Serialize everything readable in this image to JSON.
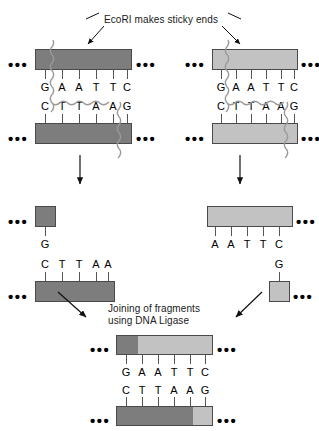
{
  "figure": {
    "title": "EcoRI makes sticky ends",
    "ligase_caption_line1": "Joining of fragments",
    "ligase_caption_line2": "using DNA Ligase",
    "ellipsis": "•••"
  },
  "colors": {
    "dark_dna": "#7d7d7d",
    "light_dna": "#c2c2c2",
    "outline": "#4a4a4a",
    "background": "#ffffff",
    "text": "#000000"
  },
  "panels": {
    "top_left": {
      "label": "uncut-dna-duplex-dark",
      "top_strand_bases": [
        "G",
        "A",
        "A",
        "T",
        "T",
        "C"
      ],
      "bottom_strand_bases": [
        "C",
        "T",
        "T",
        "A",
        "A",
        "G"
      ],
      "cut_after_top_base_index": 0,
      "cut_after_bottom_base_index": 4
    },
    "top_right": {
      "label": "uncut-dna-duplex-light",
      "top_strand_bases": [
        "G",
        "A",
        "A",
        "T",
        "T",
        "C"
      ],
      "bottom_strand_bases": [
        "C",
        "T",
        "T",
        "A",
        "A",
        "G"
      ],
      "cut_after_top_base_index": 0,
      "cut_after_bottom_base_index": 4
    },
    "mid_left": {
      "label": "cut-fragment-dark",
      "top_strand_bases": [
        "G"
      ],
      "bottom_strand_bases": [
        "C",
        "T",
        "T",
        "A",
        "A"
      ]
    },
    "mid_right": {
      "label": "cut-fragment-light",
      "top_strand_bases": [
        "A",
        "A",
        "T",
        "T",
        "C"
      ],
      "bottom_strand_bases": [
        "G"
      ]
    },
    "bottom": {
      "label": "recombinant-dna",
      "top_strand_bases": [
        "G",
        "A",
        "A",
        "T",
        "T",
        "C"
      ],
      "bottom_strand_bases": [
        "C",
        "T",
        "T",
        "A",
        "A",
        "G"
      ]
    }
  },
  "arrows": {
    "title_arrow_left": "arrow-to-left-cut-site",
    "title_arrow_right": "arrow-to-right-cut-site",
    "cut_arrow_left": "down-arrow-left",
    "cut_arrow_right": "down-arrow-right",
    "ligase_arrow_left": "diagonal-arrow-from-left-fragment",
    "ligase_arrow_right": "diagonal-arrow-from-right-fragment"
  }
}
